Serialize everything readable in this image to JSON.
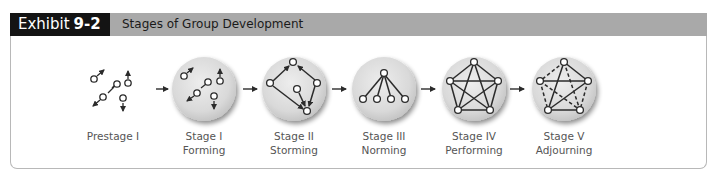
{
  "header": {
    "exhibit_prefix": "Exhibit",
    "exhibit_number": "9-2",
    "title": "Stages of Group Development"
  },
  "stages": [
    {
      "line1": "Prestage I",
      "line2": ""
    },
    {
      "line1": "Stage I",
      "line2": "Forming"
    },
    {
      "line1": "Stage II",
      "line2": "Storming"
    },
    {
      "line1": "Stage III",
      "line2": "Norming"
    },
    {
      "line1": "Stage IV",
      "line2": "Performing"
    },
    {
      "line1": "Stage V",
      "line2": "Adjourning"
    }
  ],
  "colors": {
    "header_black": "#141414",
    "header_gray": "#a9a9a9",
    "circle_fill": "#dcdcdc",
    "line": "#2b2b2b"
  }
}
